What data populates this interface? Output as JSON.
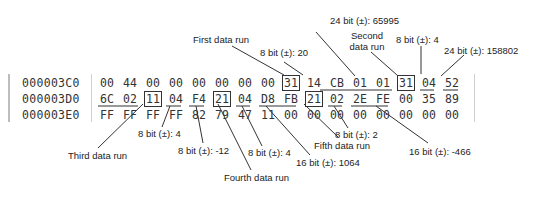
{
  "hex_dump": {
    "rows": [
      {
        "address": "000003C0",
        "bytes": [
          "00",
          "44",
          "00",
          "00",
          "00",
          "00",
          "00",
          "00",
          "31",
          "14",
          "CB",
          "01",
          "01",
          "31",
          "04",
          "52"
        ]
      },
      {
        "address": "000003D0",
        "bytes": [
          "6C",
          "02",
          "11",
          "04",
          "F4",
          "21",
          "04",
          "D8",
          "FB",
          "21",
          "02",
          "2E",
          "FE",
          "00",
          "35",
          "89"
        ]
      },
      {
        "address": "000003E0",
        "bytes": [
          "FF",
          "FF",
          "FF",
          "FF",
          "82",
          "79",
          "47",
          "11",
          "00",
          "00",
          "00",
          "00",
          "00",
          "00",
          "00",
          "00"
        ]
      }
    ]
  },
  "annotations": {
    "top": [
      {
        "id": "first_run",
        "text": "First data run"
      },
      {
        "id": "first_len",
        "text": "8 bit (±): 20"
      },
      {
        "id": "first_off",
        "text": "24 bit (±): 65995"
      },
      {
        "id": "second_run_l1",
        "text": "Second"
      },
      {
        "id": "second_run_l2",
        "text": "data run"
      },
      {
        "id": "second_len",
        "text": "8 bit (±): 4"
      },
      {
        "id": "second_off",
        "text": "24 bit (±): 158802"
      }
    ],
    "bottom": [
      {
        "id": "third_run",
        "text": "Third data run"
      },
      {
        "id": "third_len",
        "text": "8 bit (±): 4"
      },
      {
        "id": "third_off",
        "text": "8 bit (±): -12"
      },
      {
        "id": "fourth_run",
        "text": "Fourth data run"
      },
      {
        "id": "fourth_len",
        "text": "8 bit (±): 4"
      },
      {
        "id": "fourth_off",
        "text": "16 bit (±): 1064"
      },
      {
        "id": "fifth_run",
        "text": "Fifth data run"
      },
      {
        "id": "fifth_len",
        "text": "8 bit (±): 2"
      },
      {
        "id": "fifth_off",
        "text": "16 bit (±): -466"
      }
    ]
  },
  "colors": {
    "text": "#333333",
    "line": "#222222",
    "border": "#bdbdbd"
  }
}
